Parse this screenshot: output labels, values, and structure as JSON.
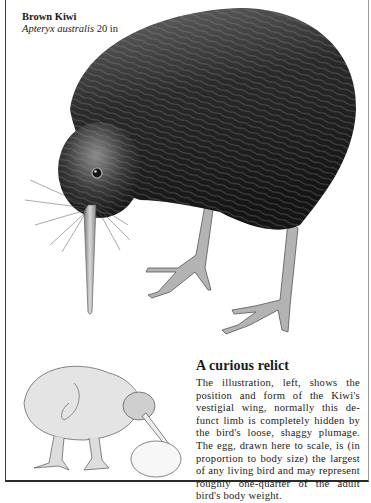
{
  "caption": {
    "common_name": "Brown Kiwi",
    "scientific_name": "Apteryx australis",
    "size": "20 in"
  },
  "article": {
    "heading": "A curious relict",
    "body": "The illustration, left, shows the position and form of the Kiwi's vestigial wing, normally this de-funct limb is completely hidden by the bird's loose, shaggy plumage. The egg, drawn here to scale, is (in proportion to body size) the largest of any living bird and may represent roughly one-quarter of the adult bird's body weight."
  },
  "illustrations": {
    "main": "brown-kiwi-foraging",
    "inset": "kiwi-skeleton-wing-and-egg"
  },
  "colors": {
    "plumage_dark": "#1c1c1c",
    "plumage_mid": "#5a5a5a",
    "legs": "#a9a9a9",
    "paper": "#ffffff",
    "frame": "#2a2a2a"
  }
}
